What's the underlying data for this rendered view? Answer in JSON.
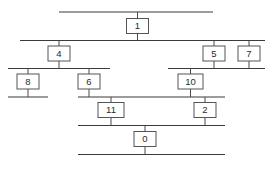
{
  "diagram": {
    "type": "precedence-graph",
    "canvas": {
      "width": 272,
      "height": 169
    },
    "style": {
      "background": "#ffffff",
      "line_color": "#3b3b3b",
      "box_stroke": "#555555",
      "box_fill": "#ffffff",
      "text_color": "#2a2a2a"
    },
    "nodes": [
      {
        "id": "n1",
        "label": "1",
        "x": 137.5,
        "y": 26,
        "w": 22,
        "h": 15
      },
      {
        "id": "n4",
        "label": "4",
        "x": 59,
        "y": 53.5,
        "w": 22,
        "h": 15
      },
      {
        "id": "n5",
        "label": "5",
        "x": 214,
        "y": 53.5,
        "w": 22,
        "h": 15
      },
      {
        "id": "n7",
        "label": "7",
        "x": 249,
        "y": 53.5,
        "w": 22,
        "h": 15
      },
      {
        "id": "n8",
        "label": "8",
        "x": 28,
        "y": 81.5,
        "w": 22,
        "h": 15
      },
      {
        "id": "n6",
        "label": "6",
        "x": 89,
        "y": 81.5,
        "w": 22,
        "h": 15
      },
      {
        "id": "n10",
        "label": "10",
        "x": 190.5,
        "y": 81.5,
        "w": 25,
        "h": 15
      },
      {
        "id": "n11",
        "label": "11",
        "x": 111,
        "y": 110,
        "w": 26,
        "h": 15
      },
      {
        "id": "n2",
        "label": "2",
        "x": 205,
        "y": 110,
        "w": 22,
        "h": 15
      },
      {
        "id": "n0",
        "label": "0",
        "x": 145,
        "y": 139,
        "w": 22,
        "h": 15
      }
    ],
    "rails": [
      {
        "id": "rail-top",
        "y": 12,
        "x1": 59,
        "x2": 213
      },
      {
        "id": "rail-level-2",
        "y": 40.5,
        "x1": 20,
        "x2": 265
      },
      {
        "id": "rail-level-3-left",
        "y": 68.5,
        "x1": 8,
        "x2": 110
      },
      {
        "id": "rail-level-3-right",
        "y": 68.5,
        "x1": 168,
        "x2": 265
      },
      {
        "id": "rail-level-4-left",
        "y": 97,
        "x1": 8,
        "x2": 48
      },
      {
        "id": "rail-level-4-right",
        "y": 97,
        "x1": 78,
        "x2": 225
      },
      {
        "id": "rail-level-5",
        "y": 125.5,
        "x1": 78,
        "x2": 225
      },
      {
        "id": "rail-bottom",
        "y": 154.5,
        "x1": 78,
        "x2": 225
      }
    ],
    "stubs": [
      {
        "id": "stub-1-in",
        "x": 137.5,
        "y1": 12,
        "y2": 18.5
      },
      {
        "id": "stub-1-out",
        "x": 137.5,
        "y1": 33.5,
        "y2": 40.5
      },
      {
        "id": "stub-4-in",
        "x": 59,
        "y1": 40.5,
        "y2": 46
      },
      {
        "id": "stub-4-out",
        "x": 59,
        "y1": 61,
        "y2": 68.5
      },
      {
        "id": "stub-5-in",
        "x": 214,
        "y1": 40.5,
        "y2": 46
      },
      {
        "id": "stub-5-out",
        "x": 214,
        "y1": 61,
        "y2": 68.5
      },
      {
        "id": "stub-7-in",
        "x": 249,
        "y1": 40.5,
        "y2": 46
      },
      {
        "id": "stub-7-out",
        "x": 249,
        "y1": 61,
        "y2": 68.5
      },
      {
        "id": "stub-8-in",
        "x": 28,
        "y1": 68.5,
        "y2": 74
      },
      {
        "id": "stub-8-out",
        "x": 28,
        "y1": 89,
        "y2": 97
      },
      {
        "id": "stub-6-in",
        "x": 89,
        "y1": 68.5,
        "y2": 74
      },
      {
        "id": "stub-6-out",
        "x": 89,
        "y1": 89,
        "y2": 97
      },
      {
        "id": "stub-10-in",
        "x": 190.5,
        "y1": 68.5,
        "y2": 74
      },
      {
        "id": "stub-10-out",
        "x": 190.5,
        "y1": 89,
        "y2": 97
      },
      {
        "id": "stub-11-in",
        "x": 111,
        "y1": 97,
        "y2": 102.5
      },
      {
        "id": "stub-11-out",
        "x": 111,
        "y1": 117.5,
        "y2": 125.5
      },
      {
        "id": "stub-2-in",
        "x": 205,
        "y1": 97,
        "y2": 102.5
      },
      {
        "id": "stub-2-out",
        "x": 205,
        "y1": 117.5,
        "y2": 125.5
      },
      {
        "id": "stub-0-in",
        "x": 145,
        "y1": 125.5,
        "y2": 131.5
      },
      {
        "id": "stub-0-out",
        "x": 145,
        "y1": 146.5,
        "y2": 154.5
      }
    ]
  }
}
